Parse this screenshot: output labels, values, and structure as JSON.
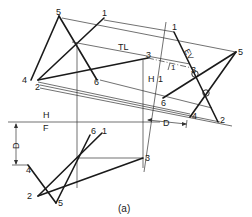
{
  "diagram": {
    "caption": "(a)",
    "fold_lines": {
      "top_left": {
        "upper": "H",
        "lower": "F"
      },
      "aux": {
        "left": "H",
        "right": "1"
      }
    },
    "annotations": {
      "true_length": "TL",
      "edge_view_label": "EV",
      "dim_d_left": "D",
      "dim_d_right": "D",
      "line_1_label": "1"
    },
    "top_view_points": {
      "p1": "1",
      "p2": "2",
      "p3": "3",
      "p4": "4",
      "p5": "5",
      "p6": "6"
    },
    "front_view_points": {
      "p1": "1",
      "p2": "2",
      "p3": "3",
      "p4": "4",
      "p5": "5",
      "p6": "6"
    },
    "aux_view_points": {
      "p1": "1",
      "p2": "2",
      "p3": "3",
      "p4": "4",
      "p5": "5",
      "p6": "6"
    }
  }
}
